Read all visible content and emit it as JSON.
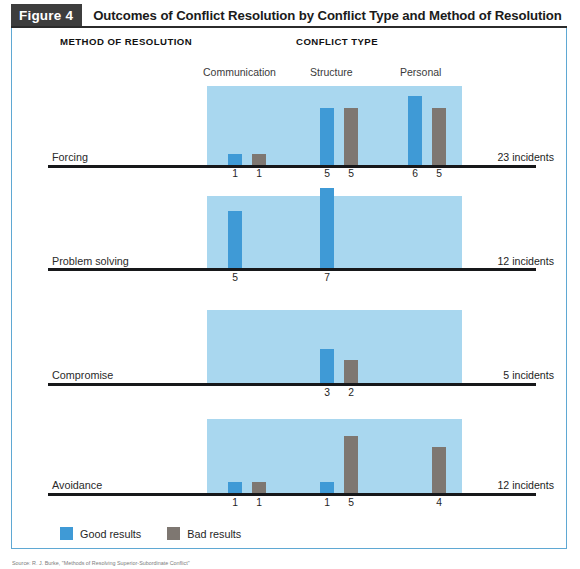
{
  "figure": {
    "tag": "Figure 4",
    "title": "Outcomes of Conflict Resolution by Conflict Type and Method of Resolution"
  },
  "headings": {
    "method": "METHOD OF RESOLUTION",
    "conflict": "CONFLICT TYPE"
  },
  "legend": {
    "good_label": "Good results",
    "bad_label": "Bad results"
  },
  "source_caption": "Source: R. J. Burke, \"Methods of Resolving Superior-Subordinate Conflict\"",
  "colors": {
    "good": "#3f9ad6",
    "bad": "#7e7771",
    "band": "#a9d7ef",
    "frame": "#5fa8d3",
    "tag_bg": "#3d3d3d",
    "axis": "#17181a"
  },
  "chart_data": {
    "type": "bar",
    "title": "Outcomes of Conflict Resolution by Conflict Type and Method of Resolution",
    "xlabel": "CONFLICT TYPE",
    "ylabel": "METHOD OF RESOLUTION",
    "grid": false,
    "legend_position": "bottom-left",
    "categories": [
      "Communication",
      "Structure",
      "Personal"
    ],
    "series": [
      {
        "name": "Good results",
        "color": "#3f9ad6"
      },
      {
        "name": "Bad results",
        "color": "#7e7771"
      }
    ],
    "panels": [
      {
        "method": "Forcing",
        "total": 23,
        "total_label": "23 incidents",
        "groups": [
          {
            "category": "Communication",
            "good": 1,
            "bad": 1
          },
          {
            "category": "Structure",
            "good": 5,
            "bad": 5
          },
          {
            "category": "Personal",
            "good": 6,
            "bad": 5
          }
        ]
      },
      {
        "method": "Problem solving",
        "total": 12,
        "total_label": "12 incidents",
        "groups": [
          {
            "category": "Communication",
            "good": 5,
            "bad": null
          },
          {
            "category": "Structure",
            "good": 7,
            "bad": null
          },
          {
            "category": "Personal",
            "good": null,
            "bad": null
          }
        ]
      },
      {
        "method": "Compromise",
        "total": 5,
        "total_label": "5 incidents",
        "groups": [
          {
            "category": "Communication",
            "good": null,
            "bad": null
          },
          {
            "category": "Structure",
            "good": 3,
            "bad": 2
          },
          {
            "category": "Personal",
            "good": null,
            "bad": null
          }
        ]
      },
      {
        "method": "Avoidance",
        "total": 12,
        "total_label": "12 incidents",
        "groups": [
          {
            "category": "Communication",
            "good": 1,
            "bad": 1
          },
          {
            "category": "Structure",
            "good": 1,
            "bad": 5
          },
          {
            "category": "Personal",
            "good": null,
            "bad": 4
          }
        ]
      }
    ]
  },
  "layout": {
    "band_left": 207,
    "band_width": 255,
    "group_good_x": [
      228,
      320,
      408
    ],
    "group_bad_x": [
      252,
      344,
      432
    ],
    "unit_px": 11.5,
    "panels_geometry": [
      {
        "band_top": 86,
        "baseline": 165,
        "label_y": 151,
        "value_y": 168
      },
      {
        "band_top": 196,
        "baseline": 268,
        "label_y": 255,
        "value_y": 272
      },
      {
        "band_top": 310,
        "baseline": 383,
        "label_y": 369,
        "value_y": 387
      },
      {
        "band_top": 419,
        "baseline": 493,
        "label_y": 479,
        "value_y": 497
      }
    ],
    "type_label_x": [
      203,
      310,
      400
    ]
  }
}
